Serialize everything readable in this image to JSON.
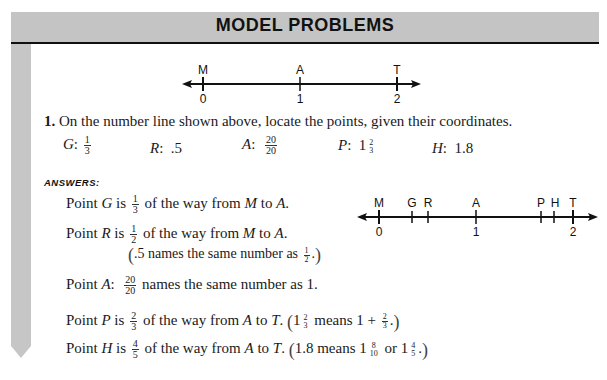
{
  "header": {
    "title": "MODEL PROBLEMS"
  },
  "number_line_top": {
    "points": [
      {
        "label": "M",
        "coord": "0",
        "x": 203
      },
      {
        "label": "A",
        "coord": "1",
        "x": 300
      },
      {
        "label": "T",
        "coord": "2",
        "x": 397
      }
    ]
  },
  "problem": {
    "number": "1.",
    "statement": "On the number line shown above, locate the points, given their coordinates.",
    "coordinates": [
      {
        "name": "G",
        "value_num": "1",
        "value_den": "3"
      },
      {
        "name": "R",
        "value": ".5"
      },
      {
        "name": "A",
        "value_num": "20",
        "value_den": "20"
      },
      {
        "name": "P",
        "whole": "1",
        "value_num": "2",
        "value_den": "3"
      },
      {
        "name": "H",
        "value": "1.8"
      }
    ]
  },
  "answers": {
    "label": "ANSWERS:",
    "lines": [
      {
        "prefix": "Point ",
        "var": "G",
        "mid": " is ",
        "frac_num": "1",
        "frac_den": "3",
        "suffix": " of the way from ",
        "from": "M",
        "to_word": " to ",
        "to": "A",
        "end": "."
      },
      {
        "prefix": "Point ",
        "var": "R",
        "mid": " is ",
        "frac_num": "1",
        "frac_den": "2",
        "suffix": " of the way from ",
        "from": "M",
        "to_word": " to ",
        "to": "A",
        "end": "."
      },
      {
        "note": ".5 names the same number as ",
        "note_num": "1",
        "note_den": "2",
        "note_end": "."
      },
      {
        "prefix": "Point ",
        "var": "A",
        "colon": ":",
        "frac_num": "20",
        "frac_den": "20",
        "suffix": " names the same number as 1."
      },
      {
        "prefix": "Point ",
        "var": "P",
        "mid": " is ",
        "frac_num": "2",
        "frac_den": "3",
        "suffix": " of the way from ",
        "from": "A",
        "to_word": " to ",
        "to": "T",
        "end": ".",
        "note_a": "1",
        "note_a_num": "2",
        "note_a_den": "3",
        "note_b": " means 1 + ",
        "note_b_num": "2",
        "note_b_den": "3",
        "note_end": "."
      },
      {
        "prefix": "Point ",
        "var": "H",
        "mid": " is ",
        "frac_num": "4",
        "frac_den": "5",
        "suffix": " of the way from ",
        "from": "A",
        "to_word": " to ",
        "to": "T",
        "end": ".",
        "note_a": "1.8 means 1",
        "note_a_num": "8",
        "note_a_den": "10",
        "note_b": " or 1",
        "note_b_num": "4",
        "note_b_den": "5",
        "note_end": "."
      }
    ]
  },
  "number_line_answer": {
    "points": [
      {
        "label": "M",
        "coord": "0",
        "x": 379
      },
      {
        "label": "G",
        "x": 412
      },
      {
        "label": "R",
        "x": 428
      },
      {
        "label": "A",
        "coord": "1",
        "x": 476
      },
      {
        "label": "P",
        "x": 541
      },
      {
        "label": "H",
        "x": 554
      },
      {
        "label": "T",
        "coord": "2",
        "x": 573
      }
    ]
  }
}
